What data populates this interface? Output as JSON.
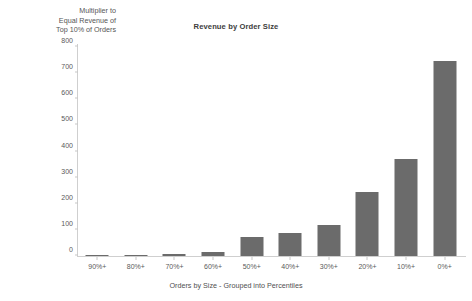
{
  "chart_data": {
    "type": "bar",
    "title": "Revenue by Order Size",
    "xlabel": "Orders by Size - Grouped into Percentiles",
    "ylabel": "Multiplier to\nEqual Revenue of\nTop 10% of Orders",
    "categories": [
      "90%+",
      "80%+",
      "70%+",
      "60%+",
      "50%+",
      "40%+",
      "30%+",
      "20%+",
      "10%+",
      "0%+"
    ],
    "values": [
      2,
      5,
      8,
      15,
      72,
      88,
      120,
      245,
      372,
      745
    ],
    "ylim": [
      0,
      800
    ],
    "yticks": [
      0,
      100,
      200,
      300,
      400,
      500,
      600,
      700,
      800
    ],
    "ytick_labels": [
      "0",
      "100",
      "200",
      "300",
      "400",
      "500",
      "600",
      "700",
      "800"
    ],
    "grid": false,
    "legend": false,
    "bar_color": "#6b6b6b",
    "axis_color": "#cfcfcf",
    "background_color": "#ffffff"
  }
}
